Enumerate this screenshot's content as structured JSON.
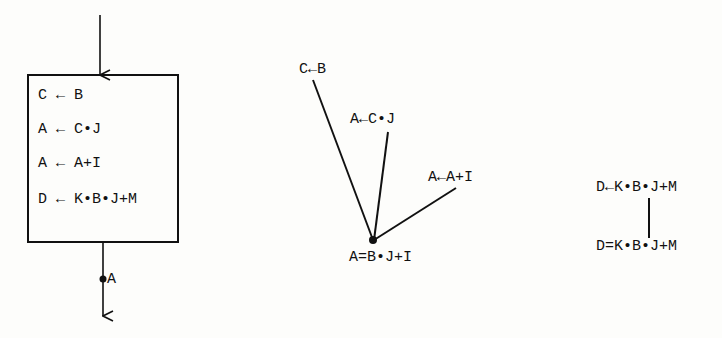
{
  "left_block": {
    "statements": [
      "C ← B",
      "A ← C•J",
      "A ← A+I",
      "D ← K•B•J+M"
    ],
    "exit_label": "A"
  },
  "middle_tree": {
    "branches": [
      "C←B",
      "A←C•J",
      "A←A+I"
    ],
    "root": "A=B•J+I"
  },
  "right_tree": {
    "top": "D←K•B•J+M",
    "bottom": "D=K•B•J+M"
  },
  "colors": {
    "ink": "#111111",
    "paper": "#fdfdfb"
  }
}
